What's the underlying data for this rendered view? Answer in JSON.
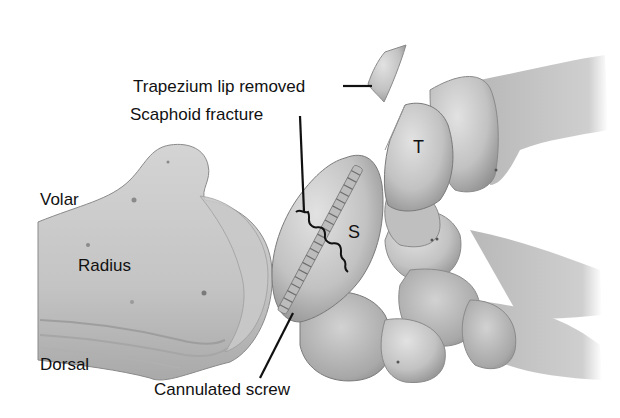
{
  "figure": {
    "colors": {
      "background": "#ffffff",
      "bone_light": "#d9d9d9",
      "bone_mid": "#bdbdbd",
      "bone_dark": "#8f8f8f",
      "outline": "#7a7a7a",
      "text": "#111111",
      "leader": "#111111"
    }
  },
  "labels": {
    "trapezium_lip": "Trapezium lip removed",
    "scaphoid_fracture": "Scaphoid fracture",
    "volar": "Volar",
    "radius": "Radius",
    "dorsal": "Dorsal",
    "cannulated_screw": "Cannulated screw",
    "scaphoid_letter": "S",
    "trapezium_letter": "T"
  }
}
